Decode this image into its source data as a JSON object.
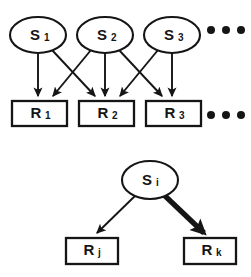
{
  "figure": {
    "name": "stimulus-response-bipartite-diagram",
    "background_color": "#ffffff",
    "stroke_color": "#151515",
    "width": 251,
    "height": 277
  },
  "panels": [
    {
      "id": "top-panel",
      "name": "many-to-many-mapping-panel",
      "stimulus_nodes": [
        {
          "id": "S1",
          "base": "S",
          "sub": "1",
          "cx": 38,
          "cy": 35,
          "rx": 28,
          "ry": 18
        },
        {
          "id": "S2",
          "base": "S",
          "sub": "2",
          "cx": 105,
          "cy": 35,
          "rx": 28,
          "ry": 18
        },
        {
          "id": "S3",
          "base": "S",
          "sub": "3",
          "cx": 172,
          "cy": 35,
          "rx": 28,
          "ry": 18
        }
      ],
      "response_nodes": [
        {
          "id": "R1",
          "base": "R",
          "sub": "1",
          "x": 12,
          "y": 101,
          "w": 55,
          "h": 25
        },
        {
          "id": "R2",
          "base": "R",
          "sub": "2",
          "x": 79,
          "y": 101,
          "w": 55,
          "h": 25
        },
        {
          "id": "R3",
          "base": "R",
          "sub": "3",
          "x": 146,
          "y": 101,
          "w": 55,
          "h": 25
        }
      ],
      "edges": [
        {
          "from": "S1",
          "to": "R1",
          "weight": "thin"
        },
        {
          "from": "S1",
          "to": "R2",
          "weight": "thin"
        },
        {
          "from": "S2",
          "to": "R1",
          "weight": "thin"
        },
        {
          "from": "S2",
          "to": "R2",
          "weight": "thin"
        },
        {
          "from": "S2",
          "to": "R3",
          "weight": "thin"
        },
        {
          "from": "S3",
          "to": "R2",
          "weight": "thin"
        },
        {
          "from": "S3",
          "to": "R3",
          "weight": "thin"
        }
      ],
      "ellipses_markers": [
        {
          "id": "stimulus-row-ellipsis",
          "cy": 30,
          "dots": [
            211,
            226,
            241
          ]
        },
        {
          "id": "response-row-ellipsis",
          "cy": 115,
          "dots": [
            211,
            226,
            241
          ]
        }
      ]
    },
    {
      "id": "bottom-panel",
      "name": "single-stimulus-weighted-panel",
      "stimulus_nodes": [
        {
          "id": "Si",
          "base": "S",
          "sub": "i",
          "cx": 150,
          "cy": 180,
          "rx": 28,
          "ry": 19
        }
      ],
      "response_nodes": [
        {
          "id": "Rj",
          "base": "R",
          "sub": "j",
          "x": 66,
          "y": 238,
          "w": 52,
          "h": 26
        },
        {
          "id": "Rk",
          "base": "R",
          "sub": "k",
          "x": 184,
          "y": 238,
          "w": 52,
          "h": 26
        }
      ],
      "edges": [
        {
          "from": "Si",
          "to": "Rj",
          "weight": "thin"
        },
        {
          "from": "Si",
          "to": "Rk",
          "weight": "thick"
        }
      ]
    }
  ]
}
